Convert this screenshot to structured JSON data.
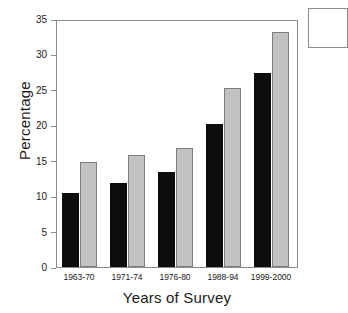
{
  "chart_data": {
    "type": "bar",
    "title": "",
    "xlabel": "Years of Survey",
    "ylabel": "Percentage",
    "categories": [
      "1963-70",
      "1971-74",
      "1976-80",
      "1988-94",
      "1999-2000"
    ],
    "series": [
      {
        "name": "dark",
        "color": "#0d0d0d",
        "values": [
          10.5,
          12.0,
          13.5,
          20.3,
          27.6
        ]
      },
      {
        "name": "light",
        "color": "#c2c2c2",
        "values": [
          15.0,
          16.0,
          17.0,
          25.5,
          33.4
        ]
      }
    ],
    "ylim": [
      0,
      35
    ],
    "yticks": [
      0,
      5,
      10,
      15,
      20,
      25,
      30,
      35
    ],
    "ytick_labels": [
      "0",
      "5",
      "10",
      "15",
      "20",
      "25",
      "30",
      "35"
    ],
    "grid": false,
    "legend_position": "top-right-clipped"
  }
}
